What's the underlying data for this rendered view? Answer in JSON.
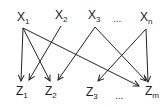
{
  "diagram": {
    "type": "bipartite-directed-graph",
    "colors": {
      "edge": "#222222",
      "text": "#222222",
      "background": "#ffffff"
    },
    "top_nodes": [
      {
        "id": "x1",
        "base": "X",
        "sub": "1",
        "x": 17,
        "y": 21,
        "anchor": [
          23,
          28
        ]
      },
      {
        "id": "x2",
        "base": "X",
        "sub": "2",
        "x": 55,
        "y": 19,
        "anchor": [
          61,
          26
        ]
      },
      {
        "id": "x3",
        "base": "X",
        "sub": "3",
        "x": 88,
        "y": 19,
        "anchor": [
          95,
          27
        ]
      },
      {
        "id": "xn",
        "base": "X",
        "sub": "n",
        "x": 140,
        "y": 21,
        "anchor": [
          146,
          29
        ]
      }
    ],
    "top_ellipsis": {
      "text": "...",
      "x": 113,
      "y": 22
    },
    "bottom_nodes": [
      {
        "id": "z1",
        "base": "Z",
        "sub": "1",
        "x": 16,
        "y": 95
      },
      {
        "id": "z2",
        "base": "Z",
        "sub": "2",
        "x": 45,
        "y": 95
      },
      {
        "id": "z3",
        "base": "Z",
        "sub": "3",
        "x": 86,
        "y": 96
      },
      {
        "id": "zm",
        "base": "Z",
        "sub": "m",
        "x": 145,
        "y": 95
      }
    ],
    "bottom_ellipsis": {
      "text": "...",
      "x": 115,
      "y": 99
    },
    "edges": [
      {
        "from": "x1",
        "to": "z1",
        "x1": 23,
        "y1": 28,
        "x2": 21,
        "y2": 81
      },
      {
        "from": "x1",
        "to": "z2",
        "x1": 23,
        "y1": 28,
        "x2": 50,
        "y2": 81
      },
      {
        "from": "x1",
        "to": "zm",
        "x1": 23,
        "y1": 28,
        "x2": 139,
        "y2": 86
      },
      {
        "from": "x2",
        "to": "z1",
        "x1": 61,
        "y1": 26,
        "x2": 29,
        "y2": 80
      },
      {
        "from": "x3",
        "to": "z2",
        "x1": 95,
        "y1": 27,
        "x2": 58,
        "y2": 80
      },
      {
        "from": "x3",
        "to": "zm",
        "x1": 95,
        "y1": 27,
        "x2": 146,
        "y2": 81
      },
      {
        "from": "xn",
        "to": "z3",
        "x1": 146,
        "y1": 29,
        "x2": 98,
        "y2": 81
      },
      {
        "from": "xn",
        "to": "zm",
        "x1": 146,
        "y1": 29,
        "x2": 148,
        "y2": 82
      }
    ]
  }
}
